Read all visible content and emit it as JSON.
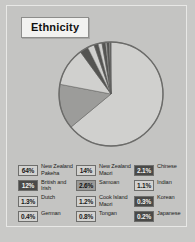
{
  "title": "Ethnicity",
  "colors": {
    "panel_bg": "#c4c4c2",
    "outer_bg": "#c9c9c7",
    "swatch_light": "#d2d2d0",
    "swatch_mid": "#9a9a98",
    "swatch_dark": "#4a4a48",
    "pie_outline": "#6b6b69"
  },
  "chart_data": {
    "type": "pie",
    "title": "Ethnicity",
    "xlabel": "",
    "ylabel": "",
    "legend_position": "bottom",
    "grid": false,
    "categories": [
      "New Zealand Pakeha",
      "New Zealand Maori",
      "British and Irish",
      "Samoan",
      "Chinese",
      "Dutch",
      "Cook Island Maori",
      "Indian",
      "German",
      "Tongan",
      "Korean",
      "Japanese"
    ],
    "values": [
      64,
      14,
      12,
      2.6,
      2.1,
      1.3,
      1.2,
      1.1,
      0.4,
      0.8,
      0.3,
      0.2
    ],
    "value_labels": [
      "64%",
      "14%",
      "12%",
      "2.6%",
      "2.1%",
      "1.3%",
      "1.2%",
      "1.1%",
      "0.4%",
      "0.8%",
      "0.3%",
      "0.2%"
    ],
    "slices": [
      {
        "label": "New Zealand Pakeha",
        "value": 64,
        "display": "64%",
        "shade": "light"
      },
      {
        "label": "New Zealand Maori",
        "value": 14,
        "display": "14%",
        "shade": "mid"
      },
      {
        "label": "British and Irish",
        "value": 12,
        "display": "12%",
        "shade": "light"
      },
      {
        "label": "Samoan",
        "value": 2.6,
        "display": "2.6%",
        "shade": "dark"
      },
      {
        "label": "Chinese",
        "value": 2.1,
        "display": "2.1%",
        "shade": "light"
      },
      {
        "label": "Dutch",
        "value": 1.3,
        "display": "1.3%",
        "shade": "dark"
      },
      {
        "label": "Cook Island Maori",
        "value": 1.2,
        "display": "1.2%",
        "shade": "light"
      },
      {
        "label": "Indian",
        "value": 1.1,
        "display": "1.1%",
        "shade": "dark"
      },
      {
        "label": "German",
        "value": 0.4,
        "display": "0.4%",
        "shade": "light"
      },
      {
        "label": "Tongan",
        "value": 0.8,
        "display": "0.8%",
        "shade": "dark"
      },
      {
        "label": "Korean",
        "value": 0.3,
        "display": "0.3%",
        "shade": "light"
      },
      {
        "label": "Japanese",
        "value": 0.2,
        "display": "0.2%",
        "shade": "dark"
      }
    ]
  },
  "legend": {
    "columns": [
      {
        "rows": [
          {
            "value": "64%",
            "label": "New Zealand Pakeha",
            "shade": "light"
          },
          {
            "value": "12%",
            "label": "British and Irish",
            "shade": "dark"
          },
          {
            "value": "1.3%",
            "label": "Dutch",
            "shade": "light"
          },
          {
            "value": "0.4%",
            "label": "German",
            "shade": "light"
          }
        ]
      },
      {
        "rows": [
          {
            "value": "14%",
            "label": "New Zealand Maori",
            "shade": "light"
          },
          {
            "value": "2.6%",
            "label": "Samoan",
            "shade": "mid"
          },
          {
            "value": "1.2%",
            "label": "Cook Island Maori",
            "shade": "light"
          },
          {
            "value": "0.8%",
            "label": "Tongan",
            "shade": "light"
          }
        ]
      },
      {
        "rows": [
          {
            "value": "2.1%",
            "label": "Chinese",
            "shade": "dark"
          },
          {
            "value": "1.1%",
            "label": "Indian",
            "shade": "light"
          },
          {
            "value": "0.3%",
            "label": "Korean",
            "shade": "dark"
          },
          {
            "value": "0.2%",
            "label": "Japanese",
            "shade": "dark"
          }
        ]
      }
    ]
  }
}
